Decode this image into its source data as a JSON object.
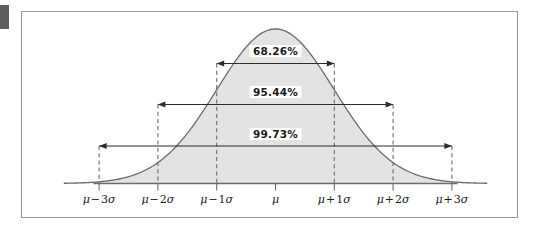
{
  "figure": {
    "type": "normal-distribution-curve",
    "frame_color": "#9a9a9a",
    "curve_color": "#6b6b6b",
    "fill_color": "#e3e3e3",
    "axis_color": "#6b6b6b",
    "text_color": "#1b1b1b",
    "corner_marker_color": "#5e5e5e"
  },
  "axis": {
    "ticks": [
      {
        "key": "minus3sigma",
        "mu": "μ",
        "op": "−",
        "coeff": "3",
        "sigma": "σ",
        "label": "μ − 3σ",
        "x_sigma": -3
      },
      {
        "key": "minus2sigma",
        "mu": "μ",
        "op": "−",
        "coeff": "2",
        "sigma": "σ",
        "label": "μ − 2σ",
        "x_sigma": -2
      },
      {
        "key": "minus1sigma",
        "mu": "μ",
        "op": "−",
        "coeff": "1",
        "sigma": "σ",
        "label": "μ − 1σ",
        "x_sigma": -1
      },
      {
        "key": "mu",
        "mu": "μ",
        "op": "",
        "coeff": "",
        "sigma": "",
        "label": "μ",
        "x_sigma": 0
      },
      {
        "key": "plus1sigma",
        "mu": "μ",
        "op": "+",
        "coeff": "1",
        "sigma": "σ",
        "label": "μ + 1σ",
        "x_sigma": 1
      },
      {
        "key": "plus2sigma",
        "mu": "μ",
        "op": "+",
        "coeff": "2",
        "sigma": "σ",
        "label": "μ + 2σ",
        "x_sigma": 2
      },
      {
        "key": "plus3sigma",
        "mu": "μ",
        "op": "+",
        "coeff": "3",
        "sigma": "σ",
        "label": "μ + 3σ",
        "x_sigma": 3
      }
    ]
  },
  "intervals": [
    {
      "key": "one-sigma",
      "label": "68.26%",
      "from_sigma": -1,
      "to_sigma": 1
    },
    {
      "key": "two-sigma",
      "label": "95.44%",
      "from_sigma": -2,
      "to_sigma": 2
    },
    {
      "key": "three-sigma",
      "label": "99.73%",
      "from_sigma": -3,
      "to_sigma": 3
    }
  ],
  "chart_data": {
    "type": "area",
    "title": "",
    "subtitle": "",
    "xlabel": "",
    "ylabel": "",
    "grid": false,
    "legend": "none",
    "distribution": "normal",
    "mean": 0,
    "stddev": 1,
    "xlim": [
      -3.6,
      3.6
    ],
    "ylim": [
      0,
      0.4
    ],
    "x": [
      -3.6,
      -3.4,
      -3.2,
      -3.0,
      -2.8,
      -2.6,
      -2.4,
      -2.2,
      -2.0,
      -1.8,
      -1.6,
      -1.4,
      -1.2,
      -1.0,
      -0.8,
      -0.6,
      -0.4,
      -0.2,
      0.0,
      0.2,
      0.4,
      0.6,
      0.8,
      1.0,
      1.2,
      1.4,
      1.6,
      1.8,
      2.0,
      2.2,
      2.4,
      2.6,
      2.8,
      3.0,
      3.2,
      3.4,
      3.6
    ],
    "y": [
      0.0006,
      0.0012,
      0.0024,
      0.0044,
      0.0079,
      0.0136,
      0.0224,
      0.0355,
      0.054,
      0.079,
      0.1109,
      0.1497,
      0.1942,
      0.242,
      0.2897,
      0.3332,
      0.3683,
      0.391,
      0.3989,
      0.391,
      0.3683,
      0.3332,
      0.2897,
      0.242,
      0.1942,
      0.1497,
      0.1109,
      0.079,
      0.054,
      0.0355,
      0.0224,
      0.0136,
      0.0079,
      0.0044,
      0.0024,
      0.0012,
      0.0006
    ],
    "tick_labels": [
      "μ − 3σ",
      "μ − 2σ",
      "μ − 1σ",
      "μ",
      "μ + 1σ",
      "μ + 2σ",
      "μ + 3σ"
    ],
    "tick_values": [
      -3,
      -2,
      -1,
      0,
      1,
      2,
      3
    ],
    "annotations": [
      {
        "text": "68.26%",
        "span_sigma": [
          -1,
          1
        ]
      },
      {
        "text": "95.44%",
        "span_sigma": [
          -2,
          2
        ]
      },
      {
        "text": "99.73%",
        "span_sigma": [
          -3,
          3
        ]
      }
    ]
  }
}
